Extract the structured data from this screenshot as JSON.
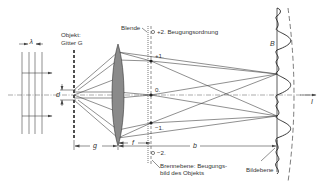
{
  "labels": {
    "object": "Objekt:",
    "grating": "Gitter G",
    "aperture": "Blende",
    "order_plus2": "+2. Beugungsordnung",
    "order_plus1": "+1.",
    "order_0": "0.",
    "order_minus1": "−1.",
    "order_minus2": "−2.",
    "focal_plane_line1": "Brennebene: Beugungs-",
    "focal_plane_line2": "bild des Objekts",
    "image_plane": "Bildebene",
    "image_symbol": "B",
    "wavelength": "λ",
    "grating_constant": "d",
    "object_distance": "g",
    "focal_length": "f",
    "image_distance": "b",
    "intensity": "I"
  },
  "colors": {
    "line": "#444444",
    "lens_fill": "#8a8a8a",
    "background": "#ffffff"
  }
}
